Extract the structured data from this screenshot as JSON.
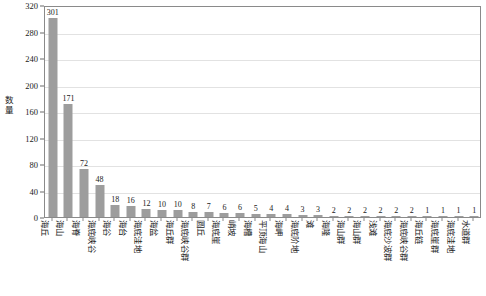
{
  "chart_data": {
    "type": "bar",
    "title": "",
    "xlabel": "",
    "ylabel": "数量",
    "ylim": [
      0,
      320
    ],
    "ytick_step": 40,
    "yticks": [
      0,
      40,
      80,
      120,
      160,
      200,
      240,
      280,
      320
    ],
    "grid": "horizontal",
    "legend": "none",
    "bar_color": "#9d9d9d",
    "categories": [
      "海丘",
      "海山",
      "海脊",
      "海底峡谷",
      "海谷",
      "海台",
      "海底洼地",
      "海盆",
      "海丘群",
      "海底峡谷群",
      "圆丘",
      "海底崖",
      "峭坡",
      "海槽",
      "平顶海山",
      "海岬",
      "海底阶地",
      "滩",
      "海隆",
      "海山群",
      "海山群",
      "浅滩",
      "海底沙波群",
      "海底峡谷群",
      "海丘链",
      "海底崖群",
      "海底洼地",
      "水道群"
    ],
    "values": [
      301,
      171,
      72,
      48,
      18,
      16,
      12,
      10,
      10,
      8,
      7,
      6,
      6,
      5,
      4,
      4,
      3,
      3,
      2,
      2,
      2,
      2,
      2,
      2,
      1,
      1,
      1,
      1
    ],
    "value_labels": [
      "301",
      "171",
      "72",
      "48",
      "18",
      "16",
      "12",
      "10",
      "10",
      "8",
      "7",
      "6",
      "6",
      "5",
      "4",
      "4",
      "3",
      "3",
      "2",
      "2",
      "2",
      "2",
      "2",
      "2",
      "1",
      "1",
      "1",
      "1"
    ]
  }
}
